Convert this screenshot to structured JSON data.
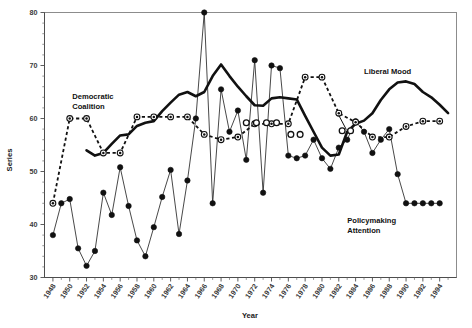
{
  "chart_data": {
    "type": "line",
    "title": "",
    "xlabel": "Year",
    "ylabel": "Series",
    "xlim": [
      1947,
      1996
    ],
    "ylim": [
      30,
      80
    ],
    "grid": false,
    "legend_position": "inline-annotations",
    "ytick_labels": [
      "30",
      "40",
      "50",
      "60",
      "70",
      "80"
    ],
    "ytick_values": [
      30,
      40,
      50,
      60,
      70,
      80
    ],
    "xtick_labels": [
      "1948",
      "1950",
      "1952",
      "1954",
      "1956",
      "1958",
      "1960",
      "1962",
      "1964",
      "1966",
      "1968",
      "1970",
      "1972",
      "1974",
      "1976",
      "1978",
      "1980",
      "1982",
      "1984",
      "1986",
      "1988",
      "1990",
      "1992",
      "1994"
    ],
    "xtick_values": [
      1948,
      1950,
      1952,
      1954,
      1956,
      1958,
      1960,
      1962,
      1964,
      1966,
      1968,
      1970,
      1972,
      1974,
      1976,
      1978,
      1980,
      1982,
      1984,
      1986,
      1988,
      1990,
      1992,
      1994
    ],
    "annotations": [
      {
        "text": "Democratic Coalition",
        "line1": "Democratic",
        "line2": "Coalition",
        "x": 1950.3,
        "y": 63.6
      },
      {
        "text": "Liberal Mood",
        "line1": "Liberal Mood",
        "line2": "",
        "x": 1985.0,
        "y": 68.4
      },
      {
        "text": "Policymaking Attention",
        "line1": "Policymaking",
        "line2": "Attention",
        "x": 1983.0,
        "y": 40.2
      }
    ],
    "series": [
      {
        "name": "Liberal Mood",
        "marker": "none",
        "style": "solid-thick",
        "color": "#111111",
        "x": [
          1952,
          1953,
          1954,
          1955,
          1956,
          1957,
          1958,
          1959,
          1960,
          1961,
          1962,
          1963,
          1964,
          1965,
          1966,
          1967,
          1968,
          1969,
          1970,
          1971,
          1972,
          1973,
          1974,
          1975,
          1976,
          1977,
          1978,
          1979,
          1980,
          1981,
          1982,
          1983,
          1984,
          1985,
          1986,
          1987,
          1988,
          1989,
          1990,
          1991,
          1992,
          1993,
          1994,
          1995
        ],
        "values": [
          54.0,
          53.0,
          53.5,
          55.2,
          56.8,
          57.0,
          58.6,
          59.2,
          59.5,
          61.4,
          63.0,
          64.5,
          65.0,
          64.2,
          65.0,
          68.0,
          70.2,
          68.0,
          66.0,
          64.2,
          62.5,
          62.4,
          63.8,
          64.0,
          63.8,
          63.6,
          60.5,
          57.5,
          54.5,
          53.0,
          53.2,
          57.5,
          59.0,
          59.6,
          61.0,
          63.5,
          65.5,
          66.8,
          67.0,
          66.5,
          65.0,
          64.0,
          62.6,
          61.0
        ]
      },
      {
        "name": "Democratic Coalition",
        "marker": "circle-dot",
        "style": "dashed",
        "color": "#111111",
        "x": [
          1948,
          1950,
          1952,
          1954,
          1956,
          1958,
          1960,
          1962,
          1964,
          1966,
          1968,
          1970,
          1972,
          1974,
          1976,
          1978,
          1980,
          1982,
          1984,
          1986,
          1988,
          1990,
          1992,
          1994
        ],
        "values": [
          44.0,
          60.0,
          60.0,
          53.5,
          53.5,
          60.3,
          60.3,
          60.3,
          60.3,
          57.0,
          56.0,
          56.5,
          59.0,
          59.0,
          59.0,
          67.8,
          67.8,
          61.0,
          59.3,
          56.5,
          56.5,
          58.5,
          59.5,
          59.5
        ]
      },
      {
        "name": "Policymaking Attention",
        "marker": "filled-circle",
        "style": "solid-thin",
        "color": "#333333",
        "x": [
          1948,
          1949,
          1950,
          1951,
          1952,
          1953,
          1954,
          1955,
          1956,
          1957,
          1958,
          1959,
          1960,
          1961,
          1962,
          1963,
          1964,
          1965,
          1966,
          1967,
          1968,
          1969,
          1970,
          1971,
          1972,
          1973,
          1974,
          1975,
          1976,
          1977,
          1978,
          1979,
          1980,
          1981,
          1982,
          1983,
          1984,
          1985,
          1986,
          1987,
          1988,
          1989,
          1990,
          1991,
          1992,
          1993,
          1994
        ],
        "values": [
          38.0,
          44.0,
          44.8,
          35.5,
          32.2,
          35.0,
          46.0,
          41.8,
          50.8,
          43.5,
          37.0,
          34.0,
          39.5,
          45.2,
          50.3,
          38.2,
          48.3,
          60.0,
          80.0,
          44.0,
          65.5,
          57.5,
          61.5,
          52.2,
          71.0,
          46.0,
          70.0,
          69.5,
          53.0,
          52.5,
          53.0,
          56.0,
          52.5,
          50.5,
          54.5,
          56.0,
          59.5,
          57.5,
          53.5,
          56.0,
          58.0,
          49.5,
          44.0,
          44.0,
          44.0,
          44.0,
          44.0
        ]
      }
    ]
  },
  "axes": {
    "y_title": "Series",
    "x_title": "Year"
  }
}
